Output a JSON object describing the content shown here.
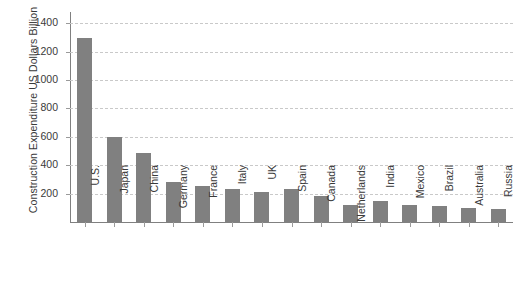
{
  "chart_data": {
    "type": "bar",
    "title": "",
    "xlabel": "",
    "ylabel": "Construction Expenditure US Dollars Billion",
    "ylim": [
      0,
      1480
    ],
    "yticks": [
      200,
      400,
      600,
      800,
      1000,
      1200,
      1400
    ],
    "ytick_labels": [
      "200",
      "400",
      "600",
      "800",
      "1000",
      "1200",
      "1400"
    ],
    "grid": "horizontal-dashed",
    "legend": "none",
    "bar_color": "#808080",
    "categories": [
      "U.S.",
      "Japan",
      "China",
      "Germany",
      "France",
      "Italy",
      "UK",
      "Spain",
      "Canada",
      "Netherlands",
      "India",
      "Mexico",
      "Brazil",
      "Australia",
      "Russia"
    ],
    "values": [
      1300,
      600,
      485,
      285,
      255,
      235,
      215,
      235,
      180,
      120,
      145,
      120,
      115,
      100,
      95
    ]
  }
}
